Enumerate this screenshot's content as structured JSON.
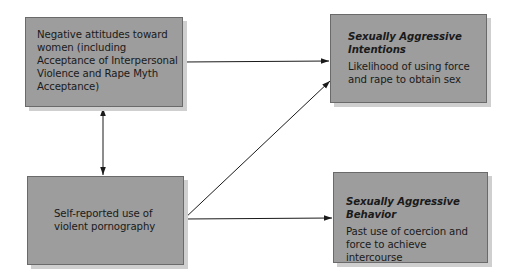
{
  "diagram": {
    "nodes": [
      {
        "id": "negative-attitudes",
        "title": "",
        "text": "Negative attitudes toward women (including Acceptance of Interpersonal Violence and Rape Myth Acceptance)"
      },
      {
        "id": "aggressive-intentions",
        "title": "Sexually Aggressive Intentions",
        "text": "Likelihood of using force and rape to obtain sex"
      },
      {
        "id": "violent-pornography",
        "title": "",
        "text": "Self-reported use of violent pornography"
      },
      {
        "id": "aggressive-behavior",
        "title": "Sexually Aggressive Behavior",
        "text": "Past use of coercion and force to achieve intercourse"
      }
    ],
    "edges": [
      {
        "from": "negative-attitudes",
        "to": "aggressive-intentions",
        "type": "directed"
      },
      {
        "from": "negative-attitudes",
        "to": "violent-pornography",
        "type": "bidirectional"
      },
      {
        "from": "violent-pornography",
        "to": "aggressive-intentions",
        "type": "directed"
      },
      {
        "from": "violent-pornography",
        "to": "aggressive-behavior",
        "type": "directed"
      }
    ],
    "colors": {
      "box_fill": "#9d9d9d",
      "box_border": "#6a6a6a",
      "box_shadow": "#cfcfcf",
      "line": "#1a1a1a"
    }
  }
}
